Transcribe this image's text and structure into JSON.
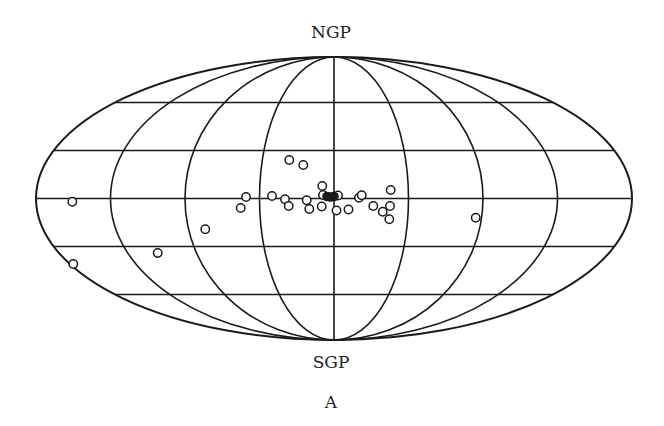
{
  "labels": {
    "north": "NGP",
    "south": "SGP",
    "panel": "A"
  },
  "colors": {
    "stroke": "#1a1a1a",
    "background": "#ffffff"
  },
  "projection": {
    "type": "Aitoff/Mollweide all-sky (galactic)",
    "center": [
      334,
      198.5
    ],
    "semi_major": 298,
    "semi_minor": 141.5,
    "meridian_fractions": [
      0.25,
      0.5,
      0.75
    ],
    "parallel_offsets": [
      -96,
      -48,
      0,
      48,
      96
    ]
  },
  "points_open": [
    [
      289.3,
      160
    ],
    [
      303.3,
      165
    ],
    [
      246,
      197
    ],
    [
      240.7,
      208
    ],
    [
      272,
      196
    ],
    [
      285,
      199.3
    ],
    [
      288.7,
      206
    ],
    [
      306.7,
      200.3
    ],
    [
      309.3,
      209
    ],
    [
      322.3,
      186
    ],
    [
      321.7,
      206.5
    ],
    [
      323,
      195
    ],
    [
      338,
      195.5
    ],
    [
      336.5,
      210.5
    ],
    [
      348.5,
      209.5
    ],
    [
      359,
      197.7
    ],
    [
      361.7,
      195.2
    ],
    [
      373.3,
      206
    ],
    [
      390.7,
      190
    ],
    [
      390,
      206
    ],
    [
      382.7,
      211.7
    ],
    [
      389.3,
      219.3
    ],
    [
      72.3,
      201.7
    ],
    [
      205.3,
      229.3
    ],
    [
      157.7,
      253
    ],
    [
      73.3,
      264
    ],
    [
      475.7,
      217.7
    ]
  ],
  "points_filled": [
    [
      327,
      196.5
    ],
    [
      330.5,
      197
    ],
    [
      334,
      196.5
    ]
  ]
}
